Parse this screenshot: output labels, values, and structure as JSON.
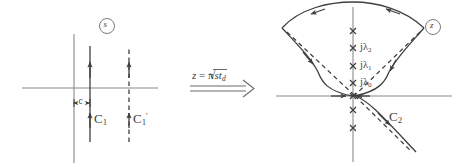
{
  "figure": {
    "type": "complex-plane contour deformation diagram",
    "panels": [
      "s-plane",
      "z-plane"
    ]
  },
  "left_panel": {
    "plane_badge": "s",
    "contour_solid_label": "C",
    "contour_solid_sub": "1",
    "contour_dashed_label": "C",
    "contour_dashed_sub": "1",
    "contour_dashed_prime": "'",
    "offset_label": "c",
    "axes": {
      "real": "horizontal",
      "imaginary": "vertical"
    }
  },
  "transform": {
    "equation_lhs": "z",
    "equation_eq": "=",
    "equation_pi": "π",
    "equation_radicand": "st",
    "equation_radicand_sub": "d",
    "arrow": "double-line-right-arrow"
  },
  "right_panel": {
    "plane_badge": "z",
    "contour_label": "C",
    "contour_sub": "2",
    "pole_labels": [
      {
        "text": "jλ",
        "sub": "2"
      },
      {
        "text": "jλ",
        "sub": "1"
      },
      {
        "text": "jλ",
        "sub": "0"
      }
    ],
    "pole_marker": "×",
    "axes": {
      "real": "horizontal",
      "imaginary": "vertical"
    }
  },
  "style": {
    "ink": "#3f3f3f",
    "axis": "#6e6e6e",
    "background": "#ffffff"
  }
}
